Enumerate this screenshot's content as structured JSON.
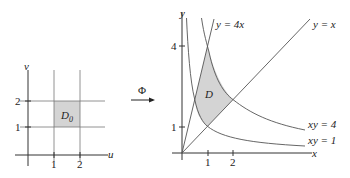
{
  "left_plot": {
    "x_axis_label": "u",
    "y_axis_label": "v",
    "x_ticks": [
      "1",
      "2"
    ],
    "y_ticks": [
      "1",
      "2"
    ],
    "region_label": "D",
    "region_subscript": "0",
    "region": {
      "u": [
        1,
        2
      ],
      "v": [
        1,
        2
      ]
    }
  },
  "map_arrow": {
    "label": "Φ"
  },
  "right_plot": {
    "x_axis_label": "x",
    "y_axis_label": "y",
    "x_ticks": [
      "1",
      "2"
    ],
    "y_ticks": [
      "1",
      "4"
    ],
    "region_label": "D",
    "curves": [
      {
        "label": "y = 4x"
      },
      {
        "label": "y = x"
      },
      {
        "label": "xy = 4"
      },
      {
        "label": "xy = 1"
      }
    ]
  },
  "colors": {
    "region_fill": "#d4d4d4",
    "line": "#555555",
    "axis": "#333333"
  }
}
